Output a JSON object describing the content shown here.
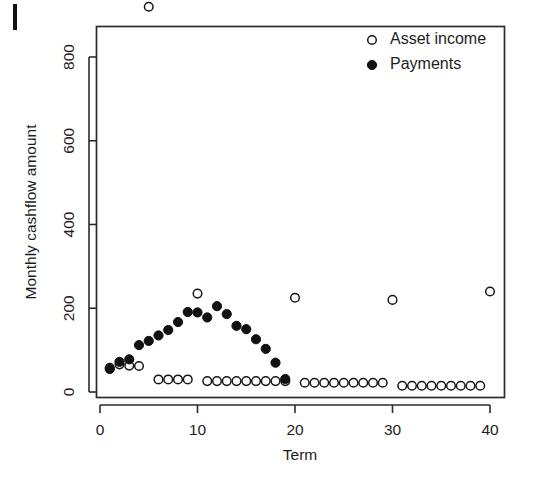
{
  "figure": {
    "background_color": "#ffffff",
    "ink_color": "#1a1a1a",
    "page_artifact_label": "page-edge-mark"
  },
  "chart_data": {
    "type": "scatter",
    "title": "",
    "xlabel": "Term",
    "ylabel": "Monthly cashflow amount",
    "xlim": [
      0.0,
      41.5
    ],
    "ylim": [
      -15,
      945
    ],
    "xticks": [
      0,
      10,
      20,
      30,
      40
    ],
    "yticks": [
      0,
      200,
      400,
      600,
      800
    ],
    "xtick_labels": [
      "0",
      "10",
      "20",
      "30",
      "40"
    ],
    "ytick_labels": [
      "0",
      "200",
      "400",
      "600",
      "800"
    ],
    "grid": false,
    "legend_position": "top-right",
    "series": [
      {
        "name": "Asset income",
        "marker": "open-circle",
        "color": "#181818",
        "x": [
          1,
          2,
          3,
          4,
          5,
          6,
          7,
          8,
          9,
          10,
          11,
          12,
          13,
          14,
          15,
          16,
          17,
          18,
          19,
          20,
          21,
          22,
          23,
          24,
          25,
          26,
          27,
          28,
          29,
          30,
          31,
          32,
          33,
          34,
          35,
          36,
          37,
          38,
          39,
          40
        ],
        "y": [
          58,
          66,
          63,
          62,
          920,
          30,
          30,
          30,
          30,
          235,
          26,
          26,
          26,
          26,
          26,
          26,
          26,
          26,
          26,
          225,
          22,
          22,
          22,
          22,
          22,
          22,
          22,
          22,
          22,
          220,
          15,
          15,
          15,
          15,
          15,
          15,
          15,
          15,
          15,
          240
        ]
      },
      {
        "name": "Payments",
        "marker": "filled-circle",
        "color": "#111111",
        "x": [
          1,
          2,
          3,
          4,
          5,
          6,
          7,
          8,
          9,
          10,
          11,
          12,
          13,
          14,
          15,
          16,
          17,
          18,
          19
        ],
        "y": [
          55,
          72,
          78,
          112,
          122,
          135,
          148,
          167,
          191,
          190,
          178,
          205,
          186,
          158,
          150,
          126,
          103,
          70,
          31
        ]
      }
    ]
  },
  "legend": {
    "entries": [
      {
        "label": "Asset income",
        "marker": "open-circle"
      },
      {
        "label": "Payments",
        "marker": "filled-circle"
      }
    ]
  }
}
